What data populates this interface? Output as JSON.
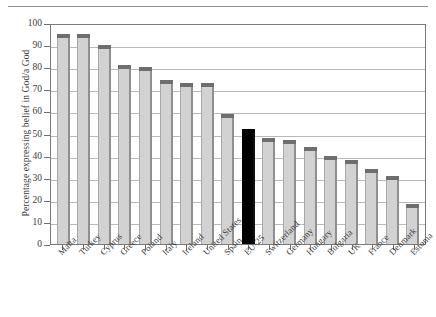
{
  "chart_data": {
    "type": "bar",
    "title": "",
    "xlabel": "",
    "ylabel": "Percentage expressing belief in God/a God",
    "ylim": [
      0,
      100
    ],
    "ytick_step": 10,
    "ytick_labels": [
      "0",
      "10",
      "20",
      "30",
      "40",
      "50",
      "60",
      "70",
      "80",
      "90",
      "100"
    ],
    "grid": true,
    "legend": "none",
    "highlight_category": "EU-25",
    "highlight_color": "#000000",
    "bar_color": "#d2d2d2",
    "bar_cap_color": "#6e6e6e",
    "categories": [
      "Malta",
      "Turkey",
      "Cyprus",
      "Greece",
      "Poland",
      "Italy",
      "Ireland",
      "United States",
      "Spain",
      "EU-25",
      "Switzerland",
      "Germany",
      "Hungary",
      "Bulgaria",
      "UK",
      "France",
      "Denmark",
      "Estonia"
    ],
    "values": [
      95,
      95,
      90,
      81,
      80,
      74,
      73,
      73,
      59,
      52,
      48,
      47,
      44,
      40,
      38,
      34,
      31,
      18
    ]
  }
}
